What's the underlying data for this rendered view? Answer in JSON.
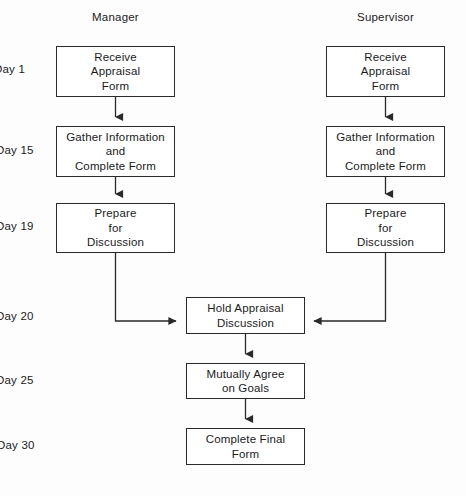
{
  "diagram": {
    "columns": [
      {
        "key": "manager",
        "label": "Manager"
      },
      {
        "key": "supervisor",
        "label": "Supervisor"
      }
    ],
    "timeline": [
      {
        "key": "day1",
        "label": "Day 1"
      },
      {
        "key": "day15",
        "label": "Day 15"
      },
      {
        "key": "day19",
        "label": "Day 19"
      },
      {
        "key": "day20",
        "label": "Day 20"
      },
      {
        "key": "day25",
        "label": "Day 25"
      },
      {
        "key": "day30",
        "label": "Day 30"
      }
    ],
    "nodes": {
      "manager_receive": "Receive\nAppraisal\nForm",
      "manager_gather": "Gather Information\nand\nComplete Form",
      "manager_prepare": "Prepare\nfor\nDiscussion",
      "supervisor_receive": "Receive\nAppraisal\nForm",
      "supervisor_gather": "Gather Information\nand\nComplete Form",
      "supervisor_prepare": "Prepare\nfor\nDiscussion",
      "hold_discussion": "Hold Appraisal\nDiscussion",
      "agree_goals": "Mutually Agree\non Goals",
      "complete_final": "Complete Final\nForm"
    },
    "colors": {
      "line": "#2a2a2a",
      "text": "#1b1b1b",
      "box_fill": "#ffffff",
      "background": "#fdfdfd"
    }
  }
}
